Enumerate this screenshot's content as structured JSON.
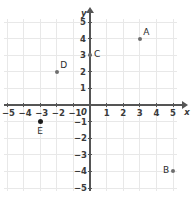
{
  "chart_data": {
    "type": "scatter",
    "title": "",
    "xlabel": "x",
    "ylabel": "y",
    "xlim": [
      -5,
      5
    ],
    "ylim": [
      -5,
      5
    ],
    "grid": true,
    "legend": "none",
    "x_ticks": [
      "-5",
      "-4",
      "-3",
      "-2",
      "-1",
      "1",
      "2",
      "3",
      "4",
      "5"
    ],
    "y_ticks": [
      "5",
      "4",
      "3",
      "2",
      "1",
      "-1",
      "-2",
      "-3",
      "-4",
      "-5"
    ],
    "origin_label": "0",
    "points": [
      {
        "label": "A",
        "x": 3,
        "y": 4,
        "label_pos": "upper-right",
        "style": "normal"
      },
      {
        "label": "B",
        "x": 5,
        "y": -4,
        "label_pos": "left",
        "style": "normal"
      },
      {
        "label": "C",
        "x": 0,
        "y": 3,
        "label_pos": "right",
        "style": "normal"
      },
      {
        "label": "D",
        "x": -2,
        "y": 2,
        "label_pos": "upper-right",
        "style": "normal"
      },
      {
        "label": "E",
        "x": -3,
        "y": -1,
        "label_pos": "below",
        "style": "bold"
      }
    ]
  },
  "colors": {
    "background": "#ffffff",
    "grid": "#e8e8e8",
    "axis": "#555555",
    "point": "#6e6e6e",
    "point_bold": "#1c1c1c",
    "text": "#3a3a3a"
  }
}
